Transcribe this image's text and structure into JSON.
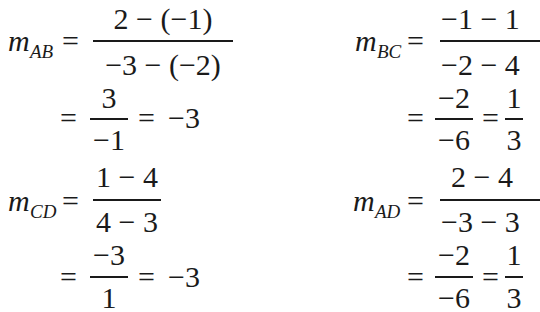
{
  "equations": {
    "ab": {
      "var": "m",
      "sub": "AB",
      "eq": "=",
      "num": "2 − (−1)",
      "den": "−3 − (−2)",
      "step2": {
        "eq1": "=",
        "num": "3",
        "den": "−1",
        "eq2": "=",
        "result": "−3"
      }
    },
    "bc": {
      "var": "m",
      "sub": "BC",
      "eq": "=",
      "num": "−1 − 1",
      "den": "−2 − 4",
      "step2": {
        "eq1": "=",
        "num": "−2",
        "den": "−6",
        "eq2": "=",
        "result_num": "1",
        "result_den": "3"
      }
    },
    "cd": {
      "var": "m",
      "sub": "CD",
      "eq": "=",
      "num": "1 − 4",
      "den": "4 − 3",
      "step2": {
        "eq1": "=",
        "num": "−3",
        "den": "1",
        "eq2": "=",
        "result": "−3"
      }
    },
    "ad": {
      "var": "m",
      "sub": "AD",
      "eq": "=",
      "num": "2 − 4",
      "den": "−3 − 3",
      "step2": {
        "eq1": "=",
        "num": "−2",
        "den": "−6",
        "eq2": "=",
        "result_num": "1",
        "result_den": "3"
      }
    }
  }
}
